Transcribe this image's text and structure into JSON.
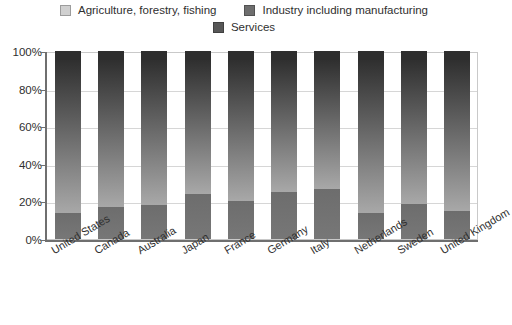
{
  "chart_data": {
    "type": "bar",
    "subtype": "stacked-100-percent",
    "title": "",
    "xlabel": "",
    "ylabel": "",
    "ylim": [
      0,
      100
    ],
    "ytick_labels": [
      "0%",
      "20%",
      "40%",
      "60%",
      "80%",
      "100%"
    ],
    "ytick_values": [
      0,
      20,
      40,
      60,
      80,
      100
    ],
    "grid": true,
    "legend_position": "top",
    "categories": [
      "United States",
      "Canada",
      "Australia",
      "Japan",
      "France",
      "Germany",
      "Italy",
      "Netherlands",
      "Sweden",
      "United Kingdom"
    ],
    "series": [
      {
        "name": "Agriculture, forestry, fishing",
        "color": "#d0d0d0",
        "values": [
          5,
          5,
          5,
          5,
          5,
          5,
          5,
          5,
          5,
          5
        ]
      },
      {
        "name": "Industry including manufacturing",
        "color": "#6e6e6e",
        "values": [
          81,
          78,
          77,
          71,
          75,
          70,
          68.5,
          81,
          76.5,
          80
        ]
      },
      {
        "name": "Services",
        "color": "#575757",
        "values": [
          14,
          17,
          18,
          24,
          20,
          25,
          26.5,
          14,
          18.5,
          15
        ]
      }
    ]
  },
  "legend": {
    "items": [
      {
        "label": "Agriculture, forestry, fishing",
        "swatch": "#d0d0d0"
      },
      {
        "label": "Industry including manufacturing",
        "swatch": "#6e6e6e"
      },
      {
        "label": "Services",
        "swatch": "#575757"
      }
    ]
  }
}
